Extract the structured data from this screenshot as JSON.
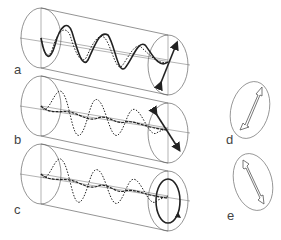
{
  "figure": {
    "panels": [
      {
        "id": "a",
        "label": "a",
        "type": "cylinder",
        "polarization": "linear",
        "description": "two in-phase waves combining to linearly polarized light"
      },
      {
        "id": "b",
        "label": "b",
        "type": "cylinder",
        "polarization": "linear",
        "description": "two waves combining to linear polarization at another angle"
      },
      {
        "id": "c",
        "label": "c",
        "type": "cylinder",
        "polarization": "circular",
        "description": "two waves with phase shift combining to circular polarization"
      },
      {
        "id": "d",
        "label": "d",
        "type": "ellipse-arrow",
        "arrow_direction": "up-right"
      },
      {
        "id": "e",
        "label": "e",
        "type": "ellipse-arrow",
        "arrow_direction": "down-right"
      }
    ],
    "colors": {
      "line": "#555555",
      "wave": "#222222",
      "background": "#ffffff"
    }
  }
}
